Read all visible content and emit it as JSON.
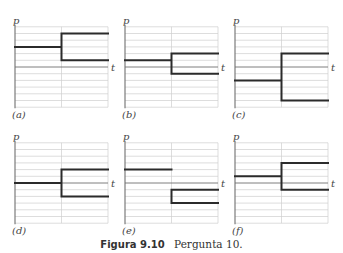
{
  "figure": {
    "caption_number": "Figura 9.10",
    "caption_text": "Pergunta 10.",
    "y_axis_label": "p",
    "x_axis_label": "t",
    "grid_units_per_half": 6,
    "line_color": "#2b2b2b",
    "grid_color": "#cfcfcf",
    "axis_color": "#6f6f6f"
  },
  "chart_data": [
    {
      "type": "line",
      "title": "(a)",
      "xlabel": "t",
      "ylabel": "p",
      "grid": true,
      "ylim": [
        -6,
        6
      ],
      "before": 3,
      "after_upper": 5,
      "after_lower": 1
    },
    {
      "type": "line",
      "title": "(b)",
      "xlabel": "t",
      "ylabel": "p",
      "grid": true,
      "ylim": [
        -6,
        6
      ],
      "before": 1,
      "after_upper": 2,
      "after_lower": -1
    },
    {
      "type": "line",
      "title": "(c)",
      "xlabel": "t",
      "ylabel": "p",
      "grid": true,
      "ylim": [
        -6,
        6
      ],
      "before": -2,
      "after_upper": 2,
      "after_lower": -5
    },
    {
      "type": "line",
      "title": "(d)",
      "xlabel": "t",
      "ylabel": "p",
      "grid": true,
      "ylim": [
        -6,
        6
      ],
      "before": 0,
      "after_upper": 2,
      "after_lower": -2
    },
    {
      "type": "line",
      "title": "(e)",
      "xlabel": "t",
      "ylabel": "p",
      "grid": true,
      "ylim": [
        -6,
        6
      ],
      "before": 2,
      "after_upper": -1,
      "after_lower": -3
    },
    {
      "type": "line",
      "title": "(f)",
      "xlabel": "t",
      "ylabel": "p",
      "grid": true,
      "ylim": [
        -6,
        6
      ],
      "before": 1,
      "after_upper": 3,
      "after_lower": -1
    }
  ]
}
